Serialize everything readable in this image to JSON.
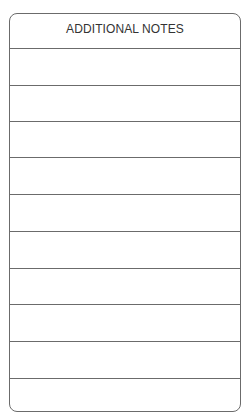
{
  "notes_card": {
    "title": "ADDITIONAL NOTES",
    "line_count": 10,
    "line_positions_px": [
      34,
      71,
      107,
      143,
      180,
      217,
      254,
      290,
      327,
      364
    ],
    "border_color": "#6b6b6b"
  }
}
